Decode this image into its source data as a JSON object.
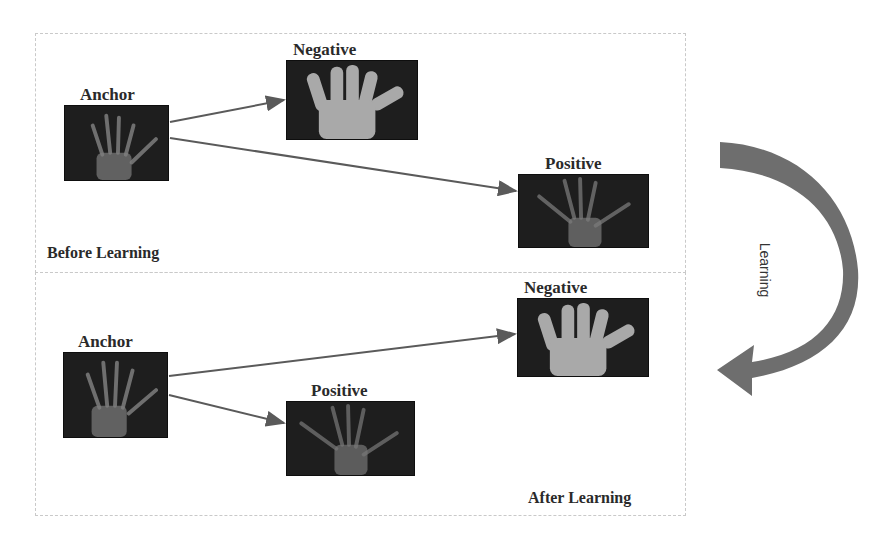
{
  "diagram": {
    "before": {
      "caption": "Before Learning",
      "anchor_label": "Anchor",
      "negative_label": "Negative",
      "positive_label": "Positive"
    },
    "after": {
      "caption": "After Learning",
      "anchor_label": "Anchor",
      "negative_label": "Negative",
      "positive_label": "Positive"
    },
    "transition_label": "Learning",
    "colors": {
      "arrow": "#5a5a5a",
      "image_bg": "#1e1e1e",
      "curved_arrow": "#6e6e6e"
    }
  }
}
